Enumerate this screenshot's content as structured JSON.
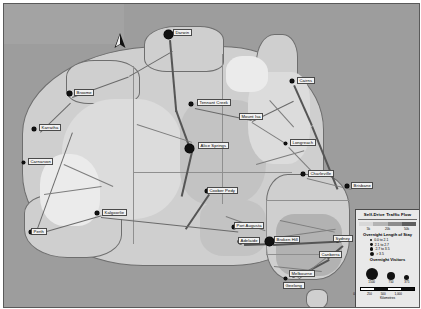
{
  "map": {
    "title": "Australia Self-Drive Traffic Flow Map",
    "north_arrow": "north-arrow",
    "land_color": "#cfcfcf",
    "ocean_color": "#9d9d9d",
    "road_color": "#6a6a6a",
    "cities": [
      {
        "name": "Darwin",
        "x": 167,
        "y": 33,
        "size": 9,
        "label_x": 172,
        "label_y": 28
      },
      {
        "name": "Broome",
        "x": 68,
        "y": 92,
        "size": 5,
        "label_x": 73,
        "label_y": 88
      },
      {
        "name": "Karratha",
        "x": 33,
        "y": 128,
        "size": 4.5,
        "label_x": 38,
        "label_y": 123
      },
      {
        "name": "Carnarvon",
        "x": 22,
        "y": 161,
        "size": 3,
        "label_x": 27,
        "label_y": 157
      },
      {
        "name": "Perth",
        "x": 30,
        "y": 231,
        "size": 4.5,
        "label_x": 30,
        "label_y": 227
      },
      {
        "name": "Kalgoorlie",
        "x": 96,
        "y": 212,
        "size": 4,
        "label_x": 101,
        "label_y": 208
      },
      {
        "name": "Tennant Creek",
        "x": 190,
        "y": 103,
        "size": 3.5,
        "label_x": 196,
        "label_y": 98
      },
      {
        "name": "Alice Springs",
        "x": 188,
        "y": 147,
        "size": 9,
        "label_x": 197,
        "label_y": 141
      },
      {
        "name": "Mount Isa",
        "x": 247,
        "y": 116,
        "size": 3.5,
        "label_x": 238,
        "label_y": 112
      },
      {
        "name": "Cairns",
        "x": 291,
        "y": 80,
        "size": 4.5,
        "label_x": 296,
        "label_y": 76
      },
      {
        "name": "Longreach",
        "x": 284,
        "y": 142,
        "size": 3,
        "label_x": 289,
        "label_y": 138
      },
      {
        "name": "Charleville",
        "x": 302,
        "y": 173,
        "size": 3.5,
        "label_x": 307,
        "label_y": 169
      },
      {
        "name": "Brisbane",
        "x": 346,
        "y": 185,
        "size": 4.5,
        "label_x": 350,
        "label_y": 181
      },
      {
        "name": "Coober Pedy",
        "x": 206,
        "y": 190,
        "size": 4,
        "label_x": 206,
        "label_y": 186
      },
      {
        "name": "Port Augusta",
        "x": 233,
        "y": 226,
        "size": 4,
        "label_x": 233,
        "label_y": 221
      },
      {
        "name": "Adelaide",
        "x": 239,
        "y": 240,
        "size": 5,
        "label_x": 237,
        "label_y": 236
      },
      {
        "name": "Broken Hill",
        "x": 268,
        "y": 240,
        "size": 9,
        "label_x": 273,
        "label_y": 235
      },
      {
        "name": "Sydney",
        "x": 336,
        "y": 238,
        "size": 5,
        "label_x": 332,
        "label_y": 234
      },
      {
        "name": "Canberra",
        "x": 322,
        "y": 254,
        "size": 3.5,
        "label_x": 318,
        "label_y": 250
      },
      {
        "name": "Melbourne",
        "x": 292,
        "y": 273,
        "size": 5,
        "label_x": 288,
        "label_y": 269
      },
      {
        "name": "Geelong",
        "x": 284,
        "y": 277,
        "size": 3,
        "label_x": 282,
        "label_y": 281
      }
    ]
  },
  "legend": {
    "title": "Self-Drive Traffic Flow",
    "flow_ticks": [
      "5k",
      "20k",
      "50k"
    ],
    "flow_ramp_colors": [
      "#d8d8d8",
      "#b4b4b4",
      "#8c8c8c",
      "#5e5e5e"
    ],
    "stay_heading": "Overnight Length of Stay",
    "stay_classes": [
      {
        "label": "0.0 to 2.1",
        "dot": 2.2
      },
      {
        "label": "2.1 to 2.7",
        "dot": 2.8
      },
      {
        "label": "2.7 to 3.5",
        "dot": 3.4
      },
      {
        "label": "> 3.5",
        "dot": 4.2
      }
    ],
    "visitors_heading": "Overnight Visitors",
    "visitor_circles": [
      {
        "value": "1500",
        "size": 12
      },
      {
        "value": "750",
        "size": 8
      },
      {
        "value": "375",
        "size": 5
      }
    ],
    "scale_values": [
      "0",
      "250",
      "500",
      "1,000"
    ],
    "scale_unit": "Kilometres",
    "scale_segment_colors": [
      "#ffffff",
      "#111111",
      "#ffffff",
      "#111111"
    ]
  }
}
